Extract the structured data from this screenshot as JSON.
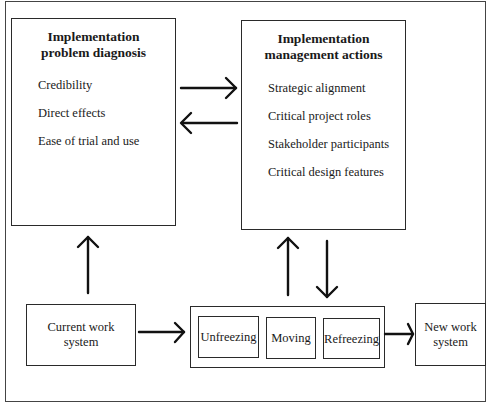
{
  "diagram": {
    "problem_diagnosis": {
      "title_line1": "Implementation",
      "title_line2": "problem diagnosis",
      "items": [
        "Credibility",
        "Direct effects",
        "Ease of trial and use"
      ]
    },
    "management_actions": {
      "title_line1": "Implementation",
      "title_line2": "management actions",
      "items": [
        "Strategic alignment",
        "Critical project roles",
        "Stakeholder participants",
        "Critical design features"
      ]
    },
    "current_system": {
      "line1": "Current work",
      "line2": "system"
    },
    "process_stages": [
      "Unfreezing",
      "Moving",
      "Refreezing"
    ],
    "new_system": {
      "line1": "New work",
      "line2": "system"
    },
    "edges": [
      {
        "from": "problem_diagnosis",
        "to": "management_actions"
      },
      {
        "from": "management_actions",
        "to": "problem_diagnosis"
      },
      {
        "from": "current_system",
        "to": "problem_diagnosis"
      },
      {
        "from": "current_system",
        "to": "change_process"
      },
      {
        "from": "change_process",
        "to": "management_actions"
      },
      {
        "from": "management_actions",
        "to": "change_process"
      },
      {
        "from": "change_process",
        "to": "new_system"
      }
    ]
  }
}
